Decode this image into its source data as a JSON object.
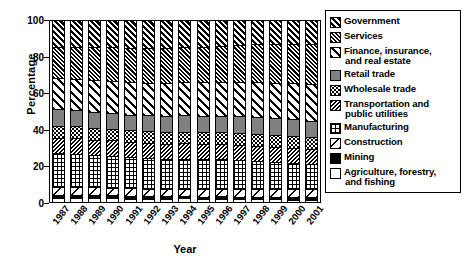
{
  "chart_data": {
    "type": "bar",
    "subtype": "stacked-bar-100-percent",
    "title": "",
    "xlabel": "Year",
    "ylabel": "Percentage",
    "ylim": [
      0,
      100
    ],
    "yticks": [
      0,
      20,
      40,
      60,
      80,
      100
    ],
    "grid": false,
    "legend_position": "right",
    "categories": [
      "1987",
      "1988",
      "1989",
      "1990",
      "1991",
      "1992",
      "1993",
      "1994",
      "1995",
      "1996",
      "1997",
      "1998",
      "1999",
      "2000",
      "2001"
    ],
    "stack_order_bottom_to_top": [
      "Agriculture, forestry, and fishing",
      "Mining",
      "Construction",
      "Manufacturing",
      "Transportation and public utilities",
      "Wholesale trade",
      "Retail trade",
      "Finance, insurance, and real estate",
      "Services",
      "Government"
    ],
    "series": [
      {
        "name": "Agriculture, forestry, and fishing",
        "pattern": "agriculture",
        "values": [
          2.0,
          2.0,
          2.0,
          2.0,
          1.9,
          1.9,
          1.8,
          1.9,
          1.7,
          1.8,
          1.6,
          1.5,
          1.4,
          1.3,
          1.3
        ]
      },
      {
        "name": "Mining",
        "pattern": "mining",
        "values": [
          1.8,
          1.7,
          1.6,
          1.6,
          1.6,
          1.4,
          1.3,
          1.3,
          1.3,
          1.4,
          1.4,
          1.2,
          1.1,
          1.3,
          1.3
        ]
      },
      {
        "name": "Construction",
        "pattern": "construction",
        "values": [
          4.6,
          4.6,
          4.4,
          4.3,
          4.0,
          3.9,
          3.9,
          4.0,
          4.0,
          4.1,
          4.2,
          4.3,
          4.4,
          4.5,
          4.5
        ]
      },
      {
        "name": "Manufacturing",
        "pattern": "manufacturing",
        "values": [
          18.5,
          18.3,
          18.0,
          17.6,
          17.2,
          17.0,
          16.8,
          16.8,
          16.7,
          16.3,
          16.0,
          15.7,
          15.1,
          14.5,
          13.9
        ]
      },
      {
        "name": "Transportation and public utilities",
        "pattern": "transportation",
        "values": [
          8.6,
          8.6,
          8.5,
          8.5,
          8.5,
          8.4,
          8.4,
          8.4,
          8.3,
          8.3,
          8.3,
          8.2,
          8.2,
          8.1,
          8.1
        ]
      },
      {
        "name": "Wholesale trade",
        "pattern": "wholesale",
        "values": [
          6.6,
          6.6,
          6.5,
          6.5,
          6.4,
          6.4,
          6.4,
          6.5,
          6.6,
          6.6,
          6.7,
          6.7,
          6.7,
          6.7,
          6.6
        ]
      },
      {
        "name": "Retail trade",
        "pattern": "retail",
        "values": [
          9.0,
          9.0,
          8.9,
          8.8,
          8.7,
          8.8,
          8.9,
          9.0,
          9.0,
          9.1,
          9.1,
          9.2,
          9.3,
          9.3,
          9.2
        ]
      },
      {
        "name": "Finance, insurance, and real estate",
        "pattern": "finance",
        "values": [
          17.2,
          17.3,
          17.5,
          17.7,
          18.0,
          18.2,
          18.4,
          18.3,
          18.5,
          18.7,
          19.0,
          19.4,
          19.6,
          19.8,
          20.2
        ]
      },
      {
        "name": "Services",
        "pattern": "services",
        "values": [
          17.2,
          17.5,
          18.0,
          18.4,
          18.9,
          19.2,
          19.4,
          19.5,
          19.7,
          20.0,
          20.4,
          20.9,
          21.4,
          21.9,
          22.4
        ]
      },
      {
        "name": "Government",
        "pattern": "government",
        "values": [
          14.5,
          14.4,
          14.6,
          14.6,
          14.8,
          14.8,
          14.7,
          14.3,
          14.2,
          13.7,
          13.3,
          12.9,
          12.8,
          12.6,
          12.5
        ]
      }
    ]
  },
  "axes": {
    "y_title": "Percentage",
    "x_title": "Year",
    "y_tick_labels": [
      "100",
      "80",
      "60",
      "40",
      "20",
      "0"
    ]
  },
  "legend": {
    "items": [
      {
        "label": "Government",
        "label_line2": "",
        "pattern": "government"
      },
      {
        "label": "Services",
        "label_line2": "",
        "pattern": "services"
      },
      {
        "label": "Finance, insurance,",
        "label_line2": "and real estate",
        "pattern": "finance"
      },
      {
        "label": "Retail trade",
        "label_line2": "",
        "pattern": "retail"
      },
      {
        "label": "Wholesale trade",
        "label_line2": "",
        "pattern": "wholesale"
      },
      {
        "label": "Transportation and",
        "label_line2": "public utilities",
        "pattern": "transportation"
      },
      {
        "label": "Manufacturing",
        "label_line2": "",
        "pattern": "manufacturing"
      },
      {
        "label": "Construction",
        "label_line2": "",
        "pattern": "construction"
      },
      {
        "label": "Mining",
        "label_line2": "",
        "pattern": "mining"
      },
      {
        "label": "Agriculture, forestry,",
        "label_line2": "and fishing",
        "pattern": "agriculture"
      }
    ]
  }
}
